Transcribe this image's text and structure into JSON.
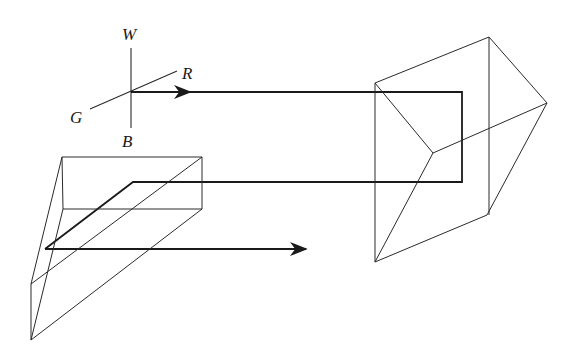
{
  "diagram": {
    "axes": {
      "labels": {
        "top": "W",
        "right": "R",
        "left": "G",
        "bottom": "B"
      }
    },
    "colors": {
      "line": "#2a2a2a",
      "ray": "#1a1a1a",
      "background": "#ffffff"
    }
  }
}
